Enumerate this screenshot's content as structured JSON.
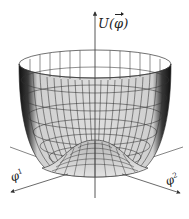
{
  "figure": {
    "vertical_axis_label": {
      "func": "U",
      "open": "(",
      "var": "φ",
      "close": ")"
    },
    "horizontal_axes": [
      {
        "symbol": "φ",
        "index": "1"
      },
      {
        "symbol": "φ",
        "index": "2"
      }
    ],
    "colors": {
      "surface_fill": "#d9d9d9",
      "surface_shadow": "#1a1a1a",
      "grid_lines": "#333333",
      "axes": "#555555",
      "background": "#ffffff"
    }
  }
}
